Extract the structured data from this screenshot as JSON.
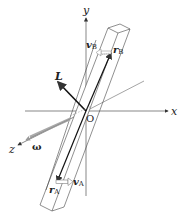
{
  "diagram": {
    "axes": {
      "x_label": "x",
      "y_label": "y",
      "z_label": "z",
      "origin_label": "O"
    },
    "vectors": {
      "angular_momentum": "L",
      "angular_velocity": "ω",
      "r_A": {
        "main": "r",
        "sub": "A"
      },
      "r_B": {
        "main": "r",
        "sub": "B"
      },
      "v_A": {
        "main": "v",
        "sub": "A"
      },
      "v_B": {
        "main": "v",
        "sub": "B"
      }
    },
    "colors": {
      "line": "#333333",
      "arrow_omega": "#999999",
      "background": "#ffffff"
    }
  }
}
